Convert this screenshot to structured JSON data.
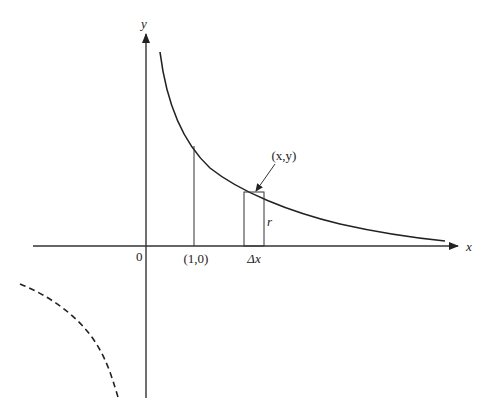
{
  "diagram": {
    "axes": {
      "x_label": "x",
      "y_label": "y",
      "origin_label": "0"
    },
    "labels": {
      "point_one": "(1,0)",
      "delta_x": "Δx",
      "point_xy": "(x,y)",
      "r": "r"
    },
    "curves": [
      {
        "name": "y = 1/x (x > 0)",
        "style": "solid"
      },
      {
        "name": "y = 1/x (x < 0)",
        "style": "dashed"
      }
    ],
    "colors": {
      "stroke": "#222222",
      "background": "#ffffff"
    }
  }
}
